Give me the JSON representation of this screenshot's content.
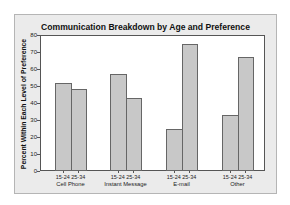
{
  "chart_data": {
    "type": "bar",
    "title": "Communication Breakdown by Age and Preference",
    "xlabel": "",
    "ylabel": "Percent Within Each Level of Preference",
    "ylim": [
      0,
      80
    ],
    "yticks": [
      0,
      10,
      20,
      30,
      40,
      50,
      60,
      70,
      80
    ],
    "grid": false,
    "legend": "none",
    "categories": [
      "Cell Phone",
      "Instant Message",
      "E-mail",
      "Other"
    ],
    "subcategories": [
      "15-24",
      "25-34"
    ],
    "series": [
      {
        "name": "15-24",
        "values": [
          52,
          57,
          25,
          33
        ]
      },
      {
        "name": "25-34",
        "values": [
          48,
          43,
          75,
          67
        ]
      }
    ],
    "bar_color": "#c8c8c8",
    "bar_edge_color": "#666666",
    "background_color": "#ebebeb"
  },
  "labels": {
    "title": "Communication Breakdown by Age and Preference",
    "ylabel": "Percent Within Each Level of Preference",
    "yticks": [
      "0",
      "10",
      "20",
      "30",
      "40",
      "50",
      "60",
      "70",
      "80"
    ],
    "groups": [
      "15-24",
      "25-34"
    ],
    "categories": [
      "Cell Phone",
      "Instant Message",
      "E-mail",
      "Other"
    ]
  }
}
